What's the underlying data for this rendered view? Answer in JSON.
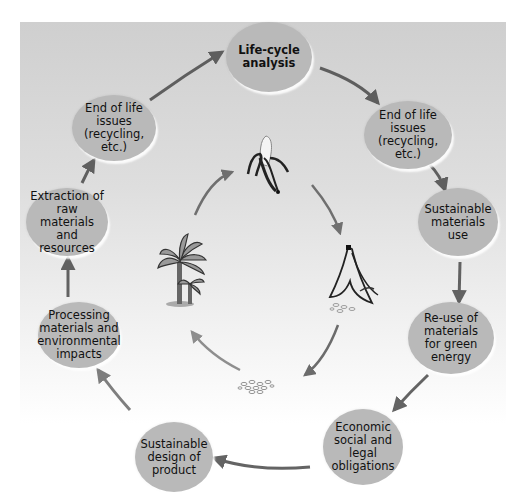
{
  "diagram": {
    "title": "Life-cycle analysis",
    "background_gradient": [
      "#cfcfcf",
      "#ffffff"
    ],
    "node_color": "#b9b9b9",
    "arrow_color": "#555555",
    "outer_cycle": [
      {
        "id": "life-cycle-analysis",
        "label": "Life-cycle\nanalysis",
        "bold": true
      },
      {
        "id": "end-of-life-right",
        "label": "End of life\nissues\n(recycling, etc.)"
      },
      {
        "id": "sustainable-materials-use",
        "label": "Sustainable\nmaterials\nuse"
      },
      {
        "id": "reuse-green-energy",
        "label": "Re-use of\nmaterials\nfor green\nenergy"
      },
      {
        "id": "economic-social-legal",
        "label": "Economic\nsocial and\nlegal\nobligations"
      },
      {
        "id": "sustainable-design",
        "label": "Sustainable\ndesign of\nproduct"
      },
      {
        "id": "processing-materials",
        "label": "Processing\nmaterials and\nenvironmental\nimpacts"
      },
      {
        "id": "extraction-raw-materials",
        "label": "Extraction of\nraw materials\nand resources"
      },
      {
        "id": "end-of-life-left",
        "label": "End of life\nissues\n(recycling, etc.)"
      }
    ],
    "inner_cycle": [
      {
        "id": "peeled-banana",
        "icon": "peeled-banana-icon"
      },
      {
        "id": "banana-peel",
        "icon": "banana-peel-icon"
      },
      {
        "id": "compost",
        "icon": "compost-icon"
      },
      {
        "id": "banana-tree",
        "icon": "banana-tree-icon"
      }
    ]
  }
}
